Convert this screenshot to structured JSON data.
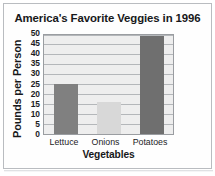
{
  "chart_data": {
    "type": "bar",
    "title": "America's Favorite Veggies in 1996",
    "xlabel": "Vegetables",
    "ylabel": "Pounds per Person",
    "categories": [
      "Lettuce",
      "Onions",
      "Potatoes"
    ],
    "values": [
      25,
      16,
      49
    ],
    "series": [
      {
        "name": "Pounds per Person",
        "values": [
          25,
          16,
          49
        ]
      }
    ],
    "ylim": [
      0,
      50
    ],
    "ytick_labels": [
      "50",
      "45",
      "40",
      "35",
      "30",
      "25",
      "20",
      "15",
      "10",
      "5",
      "0"
    ],
    "ytick_values": [
      50,
      45,
      40,
      35,
      30,
      25,
      20,
      15,
      10,
      5,
      0
    ],
    "ytick_step": 5,
    "grid": true,
    "grid_axis": "y",
    "legend": false,
    "legend_position": "none",
    "bar_colors": [
      "#808080",
      "#d8d8d8",
      "#6f6f6f"
    ],
    "plot_background": "#eeeeee",
    "gridline_color": "#b4b7ba",
    "axis_color": "#9a9da1",
    "text_color": "#17181a",
    "figure_background": "#ffffff"
  }
}
